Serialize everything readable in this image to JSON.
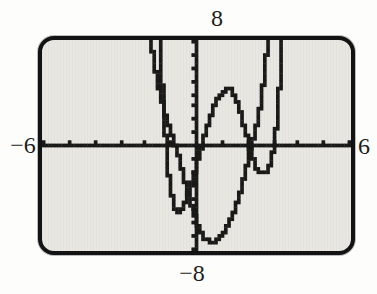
{
  "figure": {
    "window_labels": {
      "top": "8",
      "bottom": "−8",
      "left": "−6",
      "right": "6"
    }
  },
  "colors": {
    "ink": "#191917",
    "screen_bg": "#e8e7e2",
    "screen_border": "#131313",
    "page_bg": "#fdfdfc"
  },
  "chart_data": {
    "type": "line",
    "title": "",
    "xlabel": "",
    "ylabel": "",
    "grid": false,
    "legend": "none",
    "window": {
      "xmin": -6,
      "xmax": 6,
      "xscl": 1,
      "ymin": -8,
      "ymax": 8,
      "yscl": 1
    },
    "display_cols": 95,
    "display_rows": 63,
    "axes": {
      "x_axis": true,
      "y_axis": true,
      "tick_marks": true
    },
    "series": [
      {
        "name": "quartic-like curve (W shape)",
        "points": [
          [
            -1.62,
            12
          ],
          [
            -1.55,
            9.5
          ],
          [
            -1.48,
            7.4
          ],
          [
            -1.41,
            4.9
          ],
          [
            -1.33,
            2.4
          ],
          [
            -1.25,
            0
          ],
          [
            -1.16,
            -2.1
          ],
          [
            -1.06,
            -3.6
          ],
          [
            -0.93,
            -4.8
          ],
          [
            -0.8,
            -5.2
          ],
          [
            -0.68,
            -5.0
          ],
          [
            -0.55,
            -4.5
          ],
          [
            -0.42,
            -3.8
          ],
          [
            -0.3,
            -3.1
          ],
          [
            -0.15,
            -2.1
          ],
          [
            0,
            -1.0
          ],
          [
            0.15,
            0
          ],
          [
            0.3,
            1.0
          ],
          [
            0.5,
            2.3
          ],
          [
            0.7,
            3.3
          ],
          [
            0.9,
            4.0
          ],
          [
            1.1,
            4.35
          ],
          [
            1.25,
            4.35
          ],
          [
            1.4,
            3.9
          ],
          [
            1.55,
            3.2
          ],
          [
            1.7,
            2.3
          ],
          [
            1.85,
            1.2
          ],
          [
            2.0,
            0.05
          ],
          [
            2.12,
            -0.8
          ],
          [
            2.27,
            -1.6
          ],
          [
            2.42,
            -2.05
          ],
          [
            2.57,
            -2.2
          ],
          [
            2.7,
            -2.0
          ],
          [
            2.82,
            -1.4
          ],
          [
            2.93,
            -0.5
          ],
          [
            3.03,
            0.5
          ],
          [
            3.12,
            2.3
          ],
          [
            3.2,
            4.7
          ],
          [
            3.27,
            7.5
          ],
          [
            3.33,
            10.5
          ]
        ]
      },
      {
        "name": "deep U-shaped curve",
        "points": [
          [
            -2.0,
            10
          ],
          [
            -1.88,
            8.3
          ],
          [
            -1.75,
            6.7
          ],
          [
            -1.6,
            5.1
          ],
          [
            -1.45,
            3.7
          ],
          [
            -1.3,
            2.5
          ],
          [
            -1.15,
            1.5
          ],
          [
            -1.0,
            0.6
          ],
          [
            -0.88,
            0
          ],
          [
            -0.75,
            -1.0
          ],
          [
            -0.62,
            -2.0
          ],
          [
            -0.5,
            -2.9
          ],
          [
            -0.38,
            -3.8
          ],
          [
            -0.25,
            -4.7
          ],
          [
            -0.1,
            -5.6
          ],
          [
            0.05,
            -6.4
          ],
          [
            0.2,
            -7.0
          ],
          [
            0.35,
            -7.3
          ],
          [
            0.5,
            -7.45
          ],
          [
            0.65,
            -7.45
          ],
          [
            0.8,
            -7.3
          ],
          [
            1.0,
            -6.8
          ],
          [
            1.2,
            -6.1
          ],
          [
            1.4,
            -5.2
          ],
          [
            1.6,
            -4.0
          ],
          [
            1.8,
            -2.6
          ],
          [
            1.95,
            -1.3
          ],
          [
            2.08,
            0
          ],
          [
            2.22,
            0.9
          ],
          [
            2.38,
            2.1
          ],
          [
            2.52,
            4.0
          ],
          [
            2.65,
            6.3
          ],
          [
            2.74,
            8.2
          ],
          [
            2.82,
            10
          ]
        ]
      }
    ]
  }
}
